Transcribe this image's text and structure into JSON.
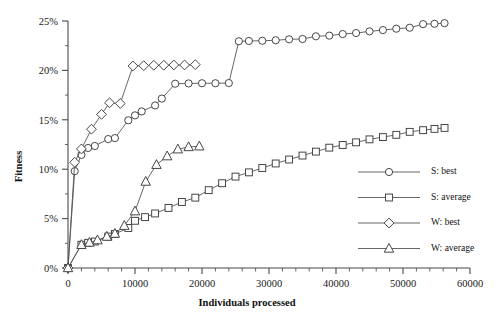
{
  "chart_data": {
    "type": "line",
    "title": "",
    "xlabel": "Individuals processed",
    "ylabel": "Fitness",
    "xlim": [
      0,
      60000
    ],
    "ylim": [
      0,
      0.25
    ],
    "grid": false,
    "legend_position": "right",
    "x_ticks": [
      0,
      10000,
      20000,
      30000,
      40000,
      50000,
      60000
    ],
    "x_tick_labels": [
      "0",
      "10000",
      "20000",
      "30000",
      "40000",
      "50000",
      "60000"
    ],
    "x_minor_step": 2000,
    "y_ticks": [
      0,
      0.05,
      0.1,
      0.15,
      0.2,
      0.25
    ],
    "y_tick_labels": [
      "0%",
      "5%",
      "10%",
      "15%",
      "20%",
      "25%"
    ],
    "y_minor_step": 0.025,
    "series": [
      {
        "name": "S: best",
        "marker": "circle",
        "points": [
          [
            0,
            0.0
          ],
          [
            1000,
            0.098
          ],
          [
            2000,
            0.1145
          ],
          [
            3000,
            0.1215
          ],
          [
            4000,
            0.1235
          ],
          [
            6000,
            0.1305
          ],
          [
            7000,
            0.1315
          ],
          [
            9000,
            0.1495
          ],
          [
            10000,
            0.1545
          ],
          [
            11000,
            0.1585
          ],
          [
            13000,
            0.1645
          ],
          [
            14000,
            0.1715
          ],
          [
            16000,
            0.1865
          ],
          [
            18000,
            0.1868
          ],
          [
            20000,
            0.187
          ],
          [
            22000,
            0.187
          ],
          [
            24000,
            0.1872
          ],
          [
            25500,
            0.2295
          ],
          [
            27000,
            0.2298
          ],
          [
            29000,
            0.23
          ],
          [
            31000,
            0.2305
          ],
          [
            33000,
            0.2315
          ],
          [
            35000,
            0.2318
          ],
          [
            37000,
            0.2345
          ],
          [
            39000,
            0.2352
          ],
          [
            41000,
            0.2368
          ],
          [
            43000,
            0.2378
          ],
          [
            45000,
            0.2395
          ],
          [
            47000,
            0.2408
          ],
          [
            49000,
            0.2422
          ],
          [
            51000,
            0.2432
          ],
          [
            53000,
            0.2468
          ],
          [
            54700,
            0.2472
          ],
          [
            56200,
            0.2478
          ]
        ]
      },
      {
        "name": "S: average",
        "marker": "square",
        "points": [
          [
            0,
            0.0
          ],
          [
            2000,
            0.0235
          ],
          [
            3000,
            0.0255
          ],
          [
            4000,
            0.0268
          ],
          [
            6000,
            0.0318
          ],
          [
            7000,
            0.0345
          ],
          [
            9000,
            0.0405
          ],
          [
            10000,
            0.0478
          ],
          [
            11500,
            0.0515
          ],
          [
            13000,
            0.0552
          ],
          [
            15000,
            0.0608
          ],
          [
            17000,
            0.0668
          ],
          [
            19000,
            0.0712
          ],
          [
            21000,
            0.0788
          ],
          [
            23000,
            0.0858
          ],
          [
            25000,
            0.0925
          ],
          [
            27000,
            0.0968
          ],
          [
            29000,
            0.1012
          ],
          [
            31000,
            0.1058
          ],
          [
            33000,
            0.1098
          ],
          [
            35000,
            0.1138
          ],
          [
            37000,
            0.1178
          ],
          [
            39000,
            0.1218
          ],
          [
            41000,
            0.1245
          ],
          [
            43000,
            0.1272
          ],
          [
            45000,
            0.1302
          ],
          [
            47000,
            0.1325
          ],
          [
            49000,
            0.1348
          ],
          [
            51000,
            0.1378
          ],
          [
            53000,
            0.1395
          ],
          [
            54700,
            0.1408
          ],
          [
            56200,
            0.1418
          ]
        ]
      },
      {
        "name": "W: best",
        "marker": "diamond",
        "points": [
          [
            0,
            0.0
          ],
          [
            1000,
            0.107
          ],
          [
            2000,
            0.1205
          ],
          [
            3500,
            0.1405
          ],
          [
            5000,
            0.1555
          ],
          [
            6200,
            0.1672
          ],
          [
            7800,
            0.1665
          ],
          [
            9700,
            0.2045
          ],
          [
            11300,
            0.2048
          ],
          [
            12800,
            0.2052
          ],
          [
            14300,
            0.2052
          ],
          [
            15800,
            0.2055
          ],
          [
            17400,
            0.2055
          ],
          [
            19000,
            0.2058
          ]
        ]
      },
      {
        "name": "W: average",
        "marker": "triangle",
        "points": [
          [
            0,
            0.0
          ],
          [
            2000,
            0.0235
          ],
          [
            3200,
            0.0258
          ],
          [
            4400,
            0.0282
          ],
          [
            5800,
            0.0318
          ],
          [
            7000,
            0.0348
          ],
          [
            8400,
            0.0428
          ],
          [
            10000,
            0.0575
          ],
          [
            11600,
            0.0875
          ],
          [
            13200,
            0.1045
          ],
          [
            14800,
            0.1132
          ],
          [
            16400,
            0.1202
          ],
          [
            18000,
            0.1225
          ],
          [
            19600,
            0.1232
          ]
        ]
      }
    ]
  },
  "legend": {
    "items": [
      {
        "label": "S: best",
        "marker": "circle"
      },
      {
        "label": "S: average",
        "marker": "square"
      },
      {
        "label": "W: best",
        "marker": "diamond"
      },
      {
        "label": "W: average",
        "marker": "triangle"
      }
    ]
  },
  "colors": {
    "axis": "#4a4a4a",
    "series_stroke": "#555555",
    "marker_stroke": "#3d3d3d",
    "marker_fill": "#ffffff",
    "text": "#111111",
    "background": "#ffffff"
  }
}
